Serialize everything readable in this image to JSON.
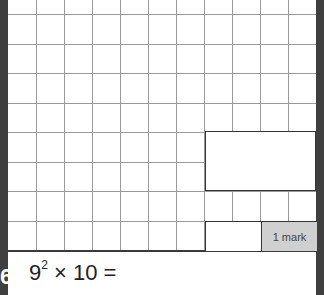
{
  "question": {
    "number": "6",
    "base": "9",
    "exponent": "2",
    "rest": " × 10 ="
  },
  "answer_box": {
    "value": ""
  },
  "marks": {
    "label": "1 mark"
  },
  "grid": {
    "vertical_lines_x": [
      36,
      64,
      92,
      120,
      148,
      176,
      204,
      232,
      260,
      288
    ],
    "horizontal_lines_y": [
      14,
      44,
      73,
      103,
      132,
      162,
      191,
      221
    ]
  },
  "colors": {
    "side_bar": "#3f3f3f",
    "grid_line": "#9a9a9a",
    "mark_fill": "#d0d0d0"
  }
}
